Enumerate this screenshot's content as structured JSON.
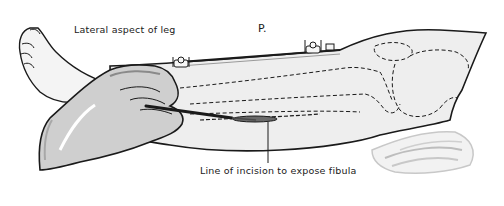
{
  "figure": {
    "title": "Lateral aspect of leg",
    "plate_label": "P.",
    "caption": "Line of incision to expose fibula",
    "colors": {
      "ink": "#1a1a1a",
      "skin_fill": "#efefef",
      "glove_fill": "#c9c9c9",
      "shadow": "#9a9a9a",
      "drape": "#d6d6d6"
    },
    "elements": [
      "foot",
      "leg",
      "gloved-hand",
      "scalpel",
      "incision-line",
      "fibula-outline",
      "knee-outline",
      "towel-clips",
      "drape"
    ]
  }
}
